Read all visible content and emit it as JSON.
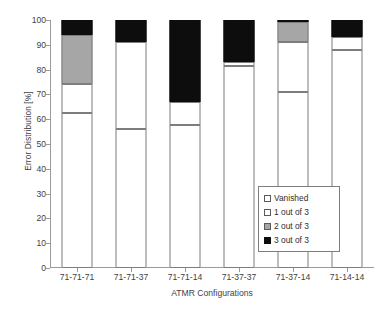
{
  "chart_data": {
    "type": "bar",
    "subtype": "stacked-bar-100-percent",
    "title": "",
    "xlabel": "ATMR Configurations",
    "ylabel": "Error Distribution [%]",
    "ylim": [
      0,
      100
    ],
    "ytick_step": 10,
    "yticks": [
      0,
      10,
      20,
      30,
      40,
      50,
      60,
      70,
      80,
      90,
      100
    ],
    "ytick_labels": [
      "0",
      "10",
      "20",
      "30",
      "40",
      "50",
      "60",
      "70",
      "80",
      "90",
      "100"
    ],
    "grid": false,
    "legend_position": "inside-bottom-right",
    "categories": [
      "71-71-71",
      "71-71-37",
      "71-71-14",
      "71-37-37",
      "71-37-14",
      "71-14-14"
    ],
    "series": [
      {
        "name": "Vanished",
        "color": "#ffffff",
        "edge_color": "#7d7d7d",
        "values": [
          62.5,
          56.0,
          57.5,
          81.5,
          71.0,
          88.0
        ]
      },
      {
        "name": "1 out of 3",
        "color": "#ffffff",
        "edge_color": "#7d7d7d",
        "values": [
          11.5,
          35.0,
          9.5,
          1.5,
          20.0,
          5.0
        ]
      },
      {
        "name": "2 out of 3",
        "color": "#a6a6a6",
        "edge_color": "#7d7d7d",
        "values": [
          20.0,
          0.0,
          0.0,
          0.0,
          8.0,
          0.0
        ]
      },
      {
        "name": "3 out of 3",
        "color": "#0d0d0d",
        "edge_color": "#0d0d0d",
        "values": [
          6.0,
          9.0,
          33.0,
          17.0,
          1.0,
          7.0
        ]
      }
    ]
  },
  "legend": {
    "items": [
      {
        "label": "Vanished",
        "swatch": "vanished"
      },
      {
        "label": "1 out of 3",
        "swatch": "one"
      },
      {
        "label": "2 out of 3",
        "swatch": "two"
      },
      {
        "label": "3 out of 3",
        "swatch": "three"
      }
    ]
  }
}
